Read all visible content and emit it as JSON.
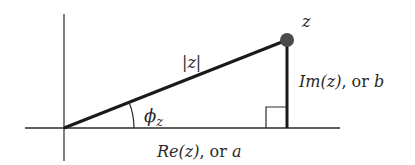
{
  "diagram": {
    "labels": {
      "point": "z",
      "modulus": "|z|",
      "angle_symbol": "ϕ",
      "angle_subscript": "z",
      "imag_prefix": "Im(z)",
      "imag_suffix": ", or ",
      "imag_var": "b",
      "real_prefix": "Re(z)",
      "real_suffix": ", or ",
      "real_var": "a"
    },
    "colors": {
      "line": "#1a1a1a",
      "axis": "#2a2a2a",
      "point": "#4a4a4a",
      "text": "#2a2a2a",
      "background": "#ffffff"
    },
    "geometry": {
      "origin": [
        64,
        128
      ],
      "point_z": [
        287,
        40
      ],
      "right_angle_box": [
        265,
        107,
        22,
        21
      ]
    }
  }
}
